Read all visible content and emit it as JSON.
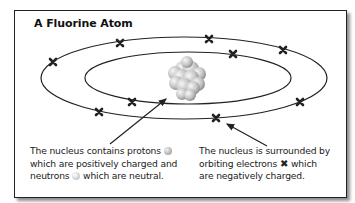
{
  "title": "A Fluorine Atom",
  "nucleus": {
    "caption_line1_prefix": "The nucleus contains protons",
    "caption_line2": "which are positively charged and",
    "caption_line3_prefix": "neutrons",
    "caption_line3_suffix": "which are neutral.",
    "proton_icon": "grey-sphere-icon",
    "neutron_icon": "light-sphere-icon"
  },
  "electrons": {
    "caption_line1": "The nucleus is surrounded by",
    "caption_line2_prefix": "orbiting electrons",
    "caption_line2_suffix": "which",
    "caption_line3": "are negatively charged.",
    "electron_icon": "x-mark-icon",
    "electron_symbol": "✖",
    "inner_shell_count": 2,
    "outer_shell_count": 7
  },
  "colors": {
    "line": "#222222",
    "sphere_light": "#f2f2f2",
    "sphere_dark": "#9a9a9a"
  }
}
